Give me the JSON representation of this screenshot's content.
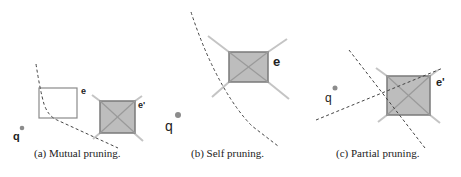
{
  "figure": {
    "panels": [
      {
        "id": "a",
        "caption": "(a) Mutual pruning.",
        "labels": {
          "query": "q",
          "entry_empty": "e",
          "entry_filled": "e'"
        }
      },
      {
        "id": "b",
        "caption": "(b) Self pruning.",
        "labels": {
          "query": "q",
          "entry_filled": "e"
        }
      },
      {
        "id": "c",
        "caption": "(c) Partial pruning.",
        "labels": {
          "query": "q",
          "entry_filled": "e'"
        }
      }
    ],
    "colors": {
      "square_fill": "#bdbdbd",
      "square_border": "#7a7a7a",
      "diagonal_lines": "#a8a8a8",
      "extension_lines": "#c2c2c2",
      "empty_rect_border": "#8a8a8a",
      "dashed_line": "#444444",
      "query_dot": "#8c8c8c"
    }
  }
}
